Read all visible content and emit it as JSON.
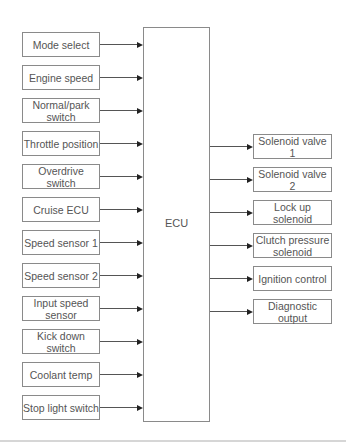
{
  "diagram": {
    "center": {
      "label": "ECU"
    },
    "inputs": [
      {
        "label": "Mode select"
      },
      {
        "label": "Engine speed"
      },
      {
        "label": "Normal/park switch"
      },
      {
        "label": "Throttle position"
      },
      {
        "label": "Overdrive switch"
      },
      {
        "label": "Cruise ECU"
      },
      {
        "label": "Speed sensor 1"
      },
      {
        "label": "Speed sensor 2"
      },
      {
        "label": "Input speed sensor"
      },
      {
        "label": "Kick down switch"
      },
      {
        "label": "Coolant temp"
      },
      {
        "label": "Stop light switch"
      }
    ],
    "outputs": [
      {
        "label": "Solenoid valve 1"
      },
      {
        "label": "Solenoid valve 2"
      },
      {
        "label": "Lock up solenoid"
      },
      {
        "label": "Clutch pressure solenoid"
      },
      {
        "label": "Ignition control"
      },
      {
        "label": "Diagnostic output"
      }
    ],
    "colors": {
      "border": "#8a8a8a",
      "text": "#555555",
      "arrow": "#222222"
    }
  }
}
